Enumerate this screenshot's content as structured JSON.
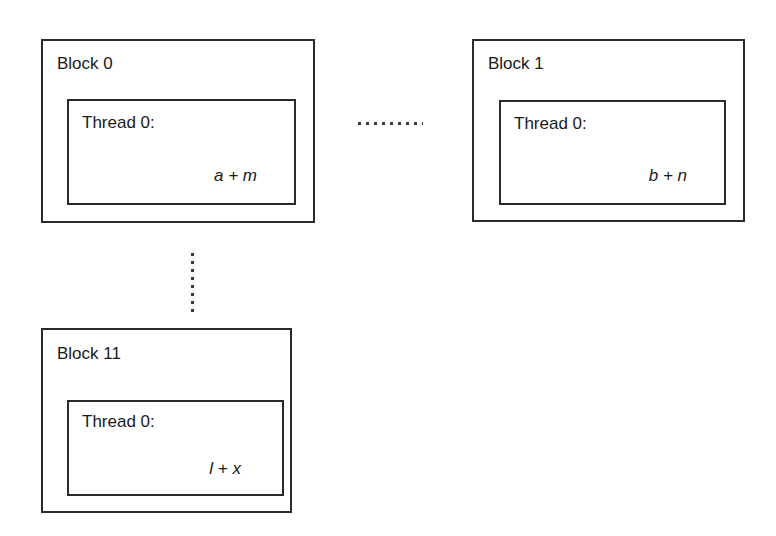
{
  "diagram": {
    "line_color": "#2b2b2b",
    "dot_color": "#3a3a3a",
    "background": "#ffffff",
    "blocks": [
      {
        "id": "block-0",
        "label": "Block 0",
        "thread_label": "Thread 0:",
        "expression": "a + m"
      },
      {
        "id": "block-1",
        "label": "Block 1",
        "thread_label": "Thread 0:",
        "expression": "b + n"
      },
      {
        "id": "block-11",
        "label": "Block 11",
        "thread_label": "Thread 0:",
        "expression": "l + x"
      }
    ],
    "connectors": [
      {
        "id": "horizontal-ellipsis",
        "orientation": "horizontal",
        "meaning": "more blocks between Block 0 and Block 1"
      },
      {
        "id": "vertical-ellipsis",
        "orientation": "vertical",
        "meaning": "more blocks between Block 0 and Block 11"
      }
    ]
  }
}
